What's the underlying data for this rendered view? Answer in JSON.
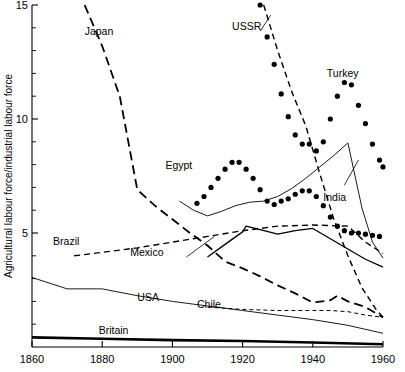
{
  "chart_data": {
    "type": "line",
    "title": "",
    "subtitle": "",
    "xlabel": "",
    "ylabel": "Agricultural labour force/industrial labour force",
    "xlim": [
      1860,
      1960
    ],
    "ylim": [
      0,
      15
    ],
    "xticks": [
      1860,
      1880,
      1900,
      1920,
      1940,
      1960
    ],
    "xticklabels": [
      "1860",
      "1880",
      "1900",
      "1920",
      "1940",
      "1960"
    ],
    "yticks": [
      5,
      10,
      15
    ],
    "yticklabels": [
      "5",
      "10",
      "15"
    ],
    "yminorticks": [
      1,
      2,
      3,
      4,
      6,
      7,
      8,
      9,
      11,
      12,
      13,
      14
    ],
    "grid": false,
    "legend": "inline-labels",
    "series": [
      {
        "name": "Japan",
        "style": "long-dashed",
        "label": "Japan",
        "label_x": 1875,
        "label_y": 13.85,
        "points": [
          [
            1875,
            15.0
          ],
          [
            1880,
            13.2
          ],
          [
            1885,
            11.0
          ],
          [
            1890,
            6.9
          ],
          [
            1895,
            6.2
          ],
          [
            1900,
            5.6
          ],
          [
            1905,
            5.0
          ],
          [
            1910,
            4.45
          ],
          [
            1915,
            3.75
          ],
          [
            1920,
            3.45
          ],
          [
            1925,
            3.1
          ],
          [
            1930,
            2.7
          ],
          [
            1935,
            2.35
          ],
          [
            1940,
            1.95
          ],
          [
            1945,
            2.05
          ],
          [
            1947,
            2.25
          ],
          [
            1950,
            2.0
          ],
          [
            1955,
            1.75
          ],
          [
            1960,
            1.3
          ]
        ]
      },
      {
        "name": "USSR",
        "style": "dashed",
        "label": "USSR",
        "label_x": 1917,
        "label_y": 14.1,
        "leader": [
          [
            1925,
            13.85
          ],
          [
            1928,
            14.55
          ]
        ],
        "points": [
          [
            1926,
            15.0
          ],
          [
            1930,
            13.0
          ],
          [
            1934,
            11.2
          ],
          [
            1938,
            9.7
          ],
          [
            1942,
            7.6
          ],
          [
            1946,
            5.6
          ],
          [
            1950,
            4.0
          ],
          [
            1954,
            2.6
          ],
          [
            1958,
            1.65
          ],
          [
            1960,
            1.3
          ]
        ]
      },
      {
        "name": "Turkey",
        "style": "dotted",
        "label": "Turkey",
        "label_x": 1944,
        "label_y": 12.0,
        "points": [
          [
            1925,
            15.0
          ],
          [
            1927,
            13.6
          ],
          [
            1929,
            12.4
          ],
          [
            1931,
            11.1
          ],
          [
            1933,
            10.1
          ],
          [
            1935,
            9.3
          ],
          [
            1937,
            8.9
          ],
          [
            1939,
            8.9
          ],
          [
            1941,
            8.6
          ],
          [
            1943,
            9.0
          ],
          [
            1945,
            10.0
          ],
          [
            1947,
            11.0
          ],
          [
            1949,
            11.6
          ],
          [
            1951,
            11.5
          ],
          [
            1953,
            10.6
          ],
          [
            1955,
            9.8
          ],
          [
            1957,
            8.9
          ],
          [
            1959,
            8.2
          ],
          [
            1960,
            7.9
          ]
        ]
      },
      {
        "name": "Egypt",
        "style": "dotted",
        "label": "Egypt",
        "label_x": 1898,
        "label_y": 8.0,
        "points": [
          [
            1907,
            6.3
          ],
          [
            1909,
            6.6
          ],
          [
            1911,
            7.0
          ],
          [
            1913,
            7.4
          ],
          [
            1915,
            7.8
          ],
          [
            1917,
            8.1
          ],
          [
            1919,
            8.1
          ],
          [
            1921,
            7.8
          ],
          [
            1923,
            7.4
          ],
          [
            1925,
            6.9
          ],
          [
            1927,
            6.4
          ],
          [
            1929,
            6.25
          ],
          [
            1931,
            6.4
          ],
          [
            1933,
            6.5
          ],
          [
            1935,
            6.7
          ],
          [
            1937,
            6.85
          ],
          [
            1939,
            6.85
          ],
          [
            1941,
            6.6
          ],
          [
            1943,
            6.2
          ],
          [
            1945,
            5.7
          ],
          [
            1947,
            5.3
          ],
          [
            1949,
            5.1
          ],
          [
            1951,
            5.0
          ],
          [
            1953,
            5.0
          ],
          [
            1955,
            4.95
          ],
          [
            1957,
            4.9
          ],
          [
            1959,
            4.85
          ]
        ]
      },
      {
        "name": "India",
        "style": "thin-solid",
        "label": "India",
        "label_x": 1943,
        "label_y": 6.6,
        "leader": [
          [
            1949,
            7.1
          ],
          [
            1953,
            8.2
          ]
        ],
        "points": [
          [
            1902,
            6.4
          ],
          [
            1906,
            6.0
          ],
          [
            1910,
            5.75
          ],
          [
            1914,
            5.95
          ],
          [
            1918,
            6.2
          ],
          [
            1922,
            6.35
          ],
          [
            1926,
            6.4
          ],
          [
            1930,
            6.6
          ],
          [
            1934,
            6.95
          ],
          [
            1938,
            7.4
          ],
          [
            1942,
            7.9
          ],
          [
            1946,
            8.4
          ],
          [
            1950,
            8.95
          ],
          [
            1954,
            6.1
          ],
          [
            1957,
            4.6
          ],
          [
            1960,
            3.9
          ]
        ]
      },
      {
        "name": "Brazil",
        "style": "dashed",
        "label": "Brazil",
        "label_x": 1866,
        "label_y": 4.65,
        "points": [
          [
            1872,
            4.0
          ],
          [
            1880,
            4.15
          ],
          [
            1890,
            4.35
          ],
          [
            1900,
            4.6
          ],
          [
            1910,
            4.85
          ],
          [
            1920,
            5.1
          ],
          [
            1930,
            5.3
          ],
          [
            1940,
            5.35
          ],
          [
            1950,
            5.3
          ],
          [
            1955,
            4.6
          ],
          [
            1960,
            4.1
          ]
        ]
      },
      {
        "name": "Mexico",
        "style": "solid",
        "label": "Mexico",
        "label_x": 1888,
        "label_y": 4.15,
        "leader": [
          [
            1904,
            3.95
          ],
          [
            1912,
            4.85
          ]
        ],
        "points": [
          [
            1910,
            3.95
          ],
          [
            1915,
            4.5
          ],
          [
            1920,
            5.05
          ],
          [
            1921,
            5.3
          ],
          [
            1925,
            5.15
          ],
          [
            1930,
            4.95
          ],
          [
            1935,
            5.1
          ],
          [
            1940,
            5.2
          ],
          [
            1945,
            4.75
          ],
          [
            1950,
            4.3
          ],
          [
            1955,
            3.85
          ],
          [
            1960,
            3.5
          ]
        ]
      },
      {
        "name": "Chile",
        "style": "fine-dashed",
        "label": "Chile",
        "label_x": 1907,
        "label_y": 1.9,
        "points": [
          [
            1910,
            1.75
          ],
          [
            1920,
            1.65
          ],
          [
            1930,
            1.6
          ],
          [
            1940,
            1.6
          ],
          [
            1945,
            1.6
          ],
          [
            1950,
            1.55
          ],
          [
            1955,
            1.4
          ],
          [
            1960,
            1.3
          ]
        ]
      },
      {
        "name": "USA",
        "style": "thin-solid",
        "label": "USA",
        "label_x": 1890,
        "label_y": 2.2,
        "points": [
          [
            1860,
            3.05
          ],
          [
            1870,
            2.55
          ],
          [
            1880,
            2.55
          ],
          [
            1890,
            2.25
          ],
          [
            1900,
            2.0
          ],
          [
            1910,
            1.8
          ],
          [
            1920,
            1.6
          ],
          [
            1930,
            1.4
          ],
          [
            1940,
            1.2
          ],
          [
            1950,
            0.95
          ],
          [
            1960,
            0.6
          ]
        ]
      },
      {
        "name": "Britain",
        "style": "thick-solid",
        "label": "Britain",
        "label_x": 1879,
        "label_y": 0.75,
        "points": [
          [
            1860,
            0.42
          ],
          [
            1880,
            0.36
          ],
          [
            1900,
            0.3
          ],
          [
            1920,
            0.26
          ],
          [
            1940,
            0.2
          ],
          [
            1960,
            0.12
          ]
        ]
      }
    ]
  }
}
